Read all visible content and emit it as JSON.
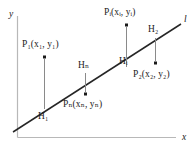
{
  "figure": {
    "line_label": "l",
    "axes": {
      "x_label": "x",
      "y_label": "y",
      "axis_color": "#b8b8b8",
      "x_axis_y": 137,
      "y_axis_x": 17
    },
    "line": {
      "color": "#262626",
      "x1": 13,
      "y1": 132,
      "x2": 181,
      "y2": 24
    },
    "points": [
      {
        "name": "P1",
        "label_P": "P",
        "label_sub": "1",
        "label_coords": "(x₁, y₁)",
        "label_full": "P₁(x₁, y₁)",
        "foot_label": "H",
        "foot_sub": "1",
        "foot_full": "H₁",
        "position": "above",
        "dot_x": 44,
        "dot_y": 57,
        "foot_x": 44,
        "foot_y": 108
      },
      {
        "name": "Pn",
        "label_P": "P",
        "label_sub": "n",
        "label_coords": "(xₙ, yₙ)",
        "label_full": "Pₙ(xₙ, yₙ)",
        "foot_label": "H",
        "foot_sub": "n",
        "foot_full": "Hₙ",
        "position": "below",
        "dot_x": 85,
        "dot_y": 94,
        "foot_x": 85,
        "foot_y": 72
      },
      {
        "name": "Pi",
        "label_P": "P",
        "label_sub": "i",
        "label_coords": "(xᵢ, yᵢ)",
        "label_full": "Pᵢ(xᵢ, yᵢ)",
        "foot_label": "H",
        "foot_sub": "i",
        "foot_full": "Hᵢ",
        "position": "above",
        "dot_x": 126,
        "dot_y": 25,
        "foot_x": 126,
        "foot_y": 66
      },
      {
        "name": "P2",
        "label_P": "P",
        "label_sub": "2",
        "label_coords": "(x₂, y₂)",
        "label_full": "P₂(x₂, y₂)",
        "foot_label": "H",
        "foot_sub": "2",
        "foot_full": "H₂",
        "position": "below",
        "dot_x": 155,
        "dot_y": 63,
        "foot_x": 155,
        "foot_y": 37
      }
    ],
    "connector_color": "#8a8a8a",
    "dot_color": "#1a1a1a"
  }
}
